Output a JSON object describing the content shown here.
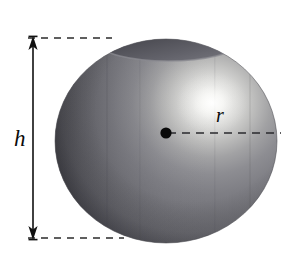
{
  "figure": {
    "type": "geometry-diagram",
    "background_color": "#ffffff"
  },
  "labels": {
    "height": "h",
    "radius": "r"
  },
  "annotations": {
    "height_dimension": {
      "name": "height-dimension-arrow",
      "label": "h",
      "orientation": "vertical",
      "arrowheads": "both-ends",
      "line_x": 33,
      "top_y": 38,
      "bottom_y": 238,
      "color": "#111111"
    },
    "radius_dimension": {
      "name": "radius-dashed-line",
      "label": "r",
      "orientation": "horizontal",
      "from_x": 166,
      "to_x": 280,
      "y": 133,
      "style": "dashed",
      "color": "#2b2b2b"
    },
    "top_extension_line": {
      "name": "top-extension-dashed-line",
      "from_x": 28,
      "to_x": 112,
      "y": 38,
      "style": "dashed"
    },
    "bottom_extension_line": {
      "name": "bottom-extension-dashed-line",
      "from_x": 28,
      "to_x": 124,
      "y": 238,
      "style": "dashed"
    },
    "center_point": {
      "name": "sphere-center-dot",
      "x": 166,
      "y": 133,
      "radius": 5.5,
      "color": "#0a0a0a"
    }
  },
  "sphere": {
    "center_x": 166,
    "center_y": 141,
    "radius_x": 111,
    "radius_y": 102,
    "top_y": 39,
    "bottom_y": 243,
    "left_x": 55,
    "right_x": 277,
    "highlight": {
      "center_x": 212,
      "center_y": 103,
      "color": "#f2f2f0"
    },
    "base_color": "#74747a",
    "shadow_color": "#4d4d52",
    "cap": {
      "name": "sphere-top-cap",
      "center_x": 168,
      "center_y": 44,
      "radius_x": 68,
      "radius_y": 17,
      "color": "#5a5a60"
    }
  },
  "colors": {
    "ink": "#111111",
    "dash": "#2b2b2b",
    "sphere_light": "#f2f2f0",
    "sphere_mid": "#7b7b80",
    "sphere_dark": "#4d4d52",
    "cap_dark": "#55555b"
  }
}
